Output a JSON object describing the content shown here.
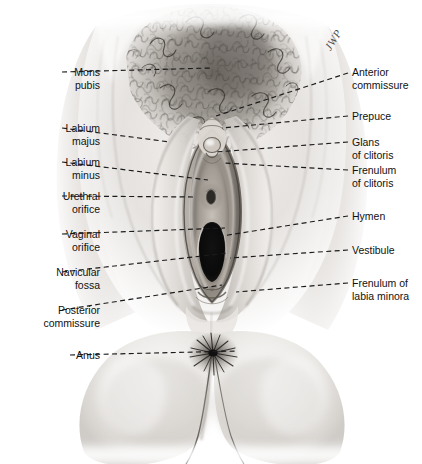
{
  "figure": {
    "title": "External Genitalia of the Female",
    "signature": "JWP",
    "width": 422,
    "height": 464,
    "background": "#ffffff",
    "ink": "#1b1b1b",
    "medium": "halftone airbrush / graphite anatomical illustration"
  },
  "labels_left": [
    {
      "id": "mons-pubis",
      "lines": [
        "Mons",
        "pubis"
      ],
      "text_x": 100,
      "text_y": 66,
      "leader": {
        "x1": 62,
        "y1": 72,
        "x2": 212,
        "y2": 68
      }
    },
    {
      "id": "labium-majus",
      "lines": [
        "Labium",
        "majus"
      ],
      "text_x": 100,
      "text_y": 122,
      "leader": {
        "x1": 62,
        "y1": 128,
        "x2": 170,
        "y2": 142
      }
    },
    {
      "id": "labium-minus",
      "lines": [
        "Labium",
        "minus"
      ],
      "text_x": 100,
      "text_y": 156,
      "leader": {
        "x1": 62,
        "y1": 162,
        "x2": 208,
        "y2": 180
      }
    },
    {
      "id": "urethral-orifice",
      "lines": [
        "Urethral",
        "orifice"
      ],
      "text_x": 100,
      "text_y": 190,
      "leader": {
        "x1": 62,
        "y1": 196,
        "x2": 196,
        "y2": 197
      }
    },
    {
      "id": "vaginal-orifice",
      "lines": [
        "Vaginal",
        "orifice"
      ],
      "text_x": 100,
      "text_y": 228,
      "leader": {
        "x1": 62,
        "y1": 234,
        "x2": 225,
        "y2": 228
      }
    },
    {
      "id": "navicular-fossa",
      "lines": [
        "Navicular",
        "fossa"
      ],
      "text_x": 100,
      "text_y": 266,
      "leader": {
        "x1": 62,
        "y1": 272,
        "x2": 228,
        "y2": 253
      }
    },
    {
      "id": "posterior-commissure",
      "lines": [
        "Posterior",
        "commissure"
      ],
      "text_x": 100,
      "text_y": 304,
      "leader": {
        "x1": 62,
        "y1": 310,
        "x2": 222,
        "y2": 285
      }
    },
    {
      "id": "anus",
      "lines": [
        "Anus"
      ],
      "text_x": 100,
      "text_y": 349,
      "leader": {
        "x1": 70,
        "y1": 355,
        "x2": 238,
        "y2": 351
      }
    }
  ],
  "labels_right": [
    {
      "id": "anterior-commissure",
      "lines": [
        "Anterior",
        "commissure"
      ],
      "text_x": 352,
      "text_y": 66,
      "leader": {
        "x1": 348,
        "y1": 73,
        "x2": 216,
        "y2": 116
      }
    },
    {
      "id": "prepuce",
      "lines": [
        "Prepuce"
      ],
      "text_x": 352,
      "text_y": 110,
      "leader": {
        "x1": 348,
        "y1": 116,
        "x2": 222,
        "y2": 128
      }
    },
    {
      "id": "glans-of-clitoris",
      "lines": [
        "Glans",
        "of clitoris"
      ],
      "text_x": 352,
      "text_y": 136,
      "leader": {
        "x1": 348,
        "y1": 142,
        "x2": 216,
        "y2": 152
      }
    },
    {
      "id": "frenulum-of-clitoris",
      "lines": [
        "Frenulum",
        "of clitoris"
      ],
      "text_x": 352,
      "text_y": 164,
      "leader": {
        "x1": 348,
        "y1": 170,
        "x2": 223,
        "y2": 163
      }
    },
    {
      "id": "hymen",
      "lines": [
        "Hymen"
      ],
      "text_x": 352,
      "text_y": 210,
      "leader": {
        "x1": 348,
        "y1": 216,
        "x2": 222,
        "y2": 236
      }
    },
    {
      "id": "vestibule",
      "lines": [
        "Vestibule"
      ],
      "text_x": 352,
      "text_y": 244,
      "leader": {
        "x1": 348,
        "y1": 250,
        "x2": 230,
        "y2": 258
      }
    },
    {
      "id": "frenulum-of-labia-minora",
      "lines": [
        "Frenulum of",
        "labia minora"
      ],
      "text_x": 352,
      "text_y": 277,
      "leader": {
        "x1": 348,
        "y1": 283,
        "x2": 236,
        "y2": 292
      }
    }
  ]
}
